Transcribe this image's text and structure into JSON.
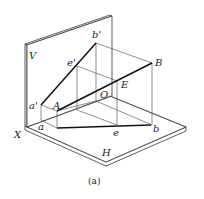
{
  "figure": {
    "caption": "(a)",
    "planes": {
      "vertical": "V",
      "horizontal": "H",
      "axis": "X"
    },
    "points": {
      "a_prime": "a'",
      "b_prime": "b'",
      "e_prime": "e'",
      "A": "A",
      "B": "B",
      "E": "E",
      "O": "O",
      "a": "a",
      "b": "b",
      "e": "e"
    }
  }
}
